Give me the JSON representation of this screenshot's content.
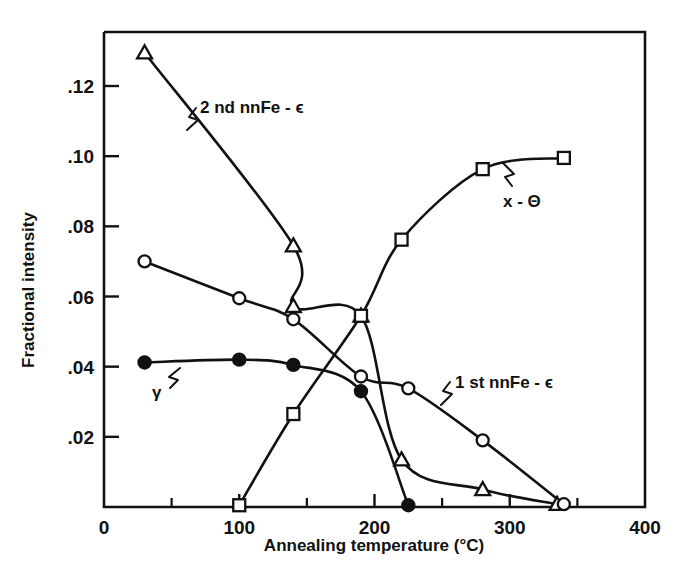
{
  "figure": {
    "background_color": "#ffffff",
    "ink_color": "#111111"
  },
  "chart_data": {
    "type": "line",
    "title": "",
    "xlabel": "Annealing temperature (°C)",
    "ylabel": "Fractional intensity",
    "xlim": [
      0,
      400
    ],
    "ylim": [
      0,
      0.134
    ],
    "grid": false,
    "legend_position": "inline-annotations",
    "x_ticks_major": [
      0,
      100,
      200,
      300,
      400
    ],
    "x_ticks_major_labels": [
      "0",
      "100",
      "200",
      "300",
      "400"
    ],
    "x_ticks_minor": [
      50,
      150,
      250,
      350
    ],
    "y_ticks_major": [
      0.02,
      0.04,
      0.06,
      0.08,
      0.1,
      0.12
    ],
    "y_ticks_major_labels": [
      ".02",
      ".04",
      ".06",
      ".08",
      ".10",
      ".12"
    ],
    "series": [
      {
        "name": "2nd nnFe-ε",
        "marker": "open-triangle",
        "annotation": "2 nd nnFe - ϵ",
        "x": [
          30,
          140,
          140,
          190,
          220,
          280,
          335
        ],
        "y": [
          0.1295,
          0.0745,
          0.0572,
          0.0545,
          0.0135,
          0.005,
          0.0008
        ]
      },
      {
        "name": "1st nnFe-ε",
        "marker": "open-circle",
        "annotation": "1 st nnFe - ϵ",
        "x": [
          30,
          100,
          140,
          190,
          225,
          280,
          340
        ],
        "y": [
          0.07,
          0.0595,
          0.0535,
          0.0372,
          0.0338,
          0.019,
          0.0008
        ]
      },
      {
        "name": "x-Θ",
        "marker": "open-square",
        "annotation": "x - Θ",
        "x": [
          100,
          140,
          190,
          220,
          280,
          340
        ],
        "y": [
          0.0005,
          0.0265,
          0.0545,
          0.0762,
          0.0963,
          0.0995
        ]
      },
      {
        "name": "γ",
        "marker": "filled-circle",
        "annotation": "γ",
        "x": [
          30,
          100,
          140,
          190,
          225
        ],
        "y": [
          0.0412,
          0.042,
          0.0405,
          0.033,
          0.0005
        ]
      }
    ],
    "annotations": [
      {
        "text": "2 nd nnFe - ϵ",
        "x_px": 200,
        "y_px": 113
      },
      {
        "text": "1 st nnFe - ϵ",
        "x_px": 455,
        "y_px": 388
      },
      {
        "text": "x - Θ",
        "x_px": 503,
        "y_px": 207
      },
      {
        "text": "γ",
        "x_px": 152,
        "y_px": 398
      }
    ]
  }
}
